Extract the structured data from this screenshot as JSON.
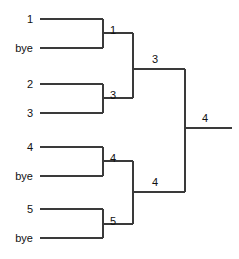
{
  "diagram": {
    "kind": "single-elimination-tournament-bracket",
    "line_color": "#3a3a3a",
    "text_color": "#111111",
    "background_color": "#ffffff",
    "width": 239,
    "height": 259
  },
  "entrants": [
    {
      "label": "1",
      "row": 0,
      "y": 19
    },
    {
      "label": "bye",
      "row": 1,
      "y": 48
    },
    {
      "label": "2",
      "row": 2,
      "y": 84
    },
    {
      "label": "3",
      "row": 3,
      "y": 113
    },
    {
      "label": "4",
      "row": 4,
      "y": 147
    },
    {
      "label": "bye",
      "row": 5,
      "y": 176
    },
    {
      "label": "5",
      "row": 6,
      "y": 209
    },
    {
      "label": "bye",
      "row": 7,
      "y": 238
    }
  ],
  "round1": {
    "name": "Round 1",
    "matches": [
      {
        "id": "m1",
        "top": "1",
        "bottom": "bye",
        "winner": "1",
        "winner_y": 33,
        "x": 103
      },
      {
        "id": "m2",
        "top": "2",
        "bottom": "3",
        "winner": "3",
        "winner_y": 98,
        "x": 103
      },
      {
        "id": "m3",
        "top": "4",
        "bottom": "bye",
        "winner": "4",
        "winner_y": 161,
        "x": 103
      },
      {
        "id": "m4",
        "top": "5",
        "bottom": "bye",
        "winner": "5",
        "winner_y": 224,
        "x": 103
      }
    ]
  },
  "round2": {
    "name": "Semifinals",
    "matches": [
      {
        "id": "m5",
        "top": "1",
        "bottom": "3",
        "winner": "3",
        "winner_y": 69,
        "x": 133
      },
      {
        "id": "m6",
        "top": "4",
        "bottom": "5",
        "winner": "4",
        "winner_y": 192,
        "x": 133
      }
    ]
  },
  "round3": {
    "name": "Final",
    "matches": [
      {
        "id": "m7",
        "top": "3",
        "bottom": "4",
        "winner": "4",
        "winner_y": 128,
        "x": 185
      }
    ]
  },
  "champion": {
    "label": "4",
    "y": 128
  },
  "labels": {
    "seed_1": "1",
    "seed_bye_1": "bye",
    "seed_2": "2",
    "seed_3": "3",
    "seed_4": "4",
    "seed_bye_2": "bye",
    "seed_5": "5",
    "seed_bye_3": "bye",
    "w_r1_m1": "1",
    "w_r1_m2": "3",
    "w_r1_m3": "4",
    "w_r1_m4": "5",
    "w_r2_m5": "3",
    "w_r2_m6": "4",
    "w_r3_m7": "4"
  }
}
